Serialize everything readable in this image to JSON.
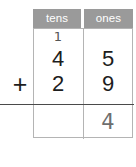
{
  "worksheet": {
    "type": "column-addition",
    "operator": "+",
    "columns": [
      {
        "key": "tens",
        "label": "tens"
      },
      {
        "key": "ones",
        "label": "ones"
      }
    ],
    "carry": {
      "tens": "1",
      "ones": ""
    },
    "addend_1": {
      "tens": "4",
      "ones": "5"
    },
    "addend_2": {
      "tens": "2",
      "ones": "9"
    },
    "sum": {
      "tens": "",
      "ones": "4"
    },
    "colors": {
      "header_background": "#9a9a9a",
      "header_text": "#ffffff",
      "grid_border": "#b4b4b4",
      "rule_line": "#4a4a4a",
      "printed_digit": "#1d1d1d",
      "handwritten_digit": "#6e6e6e",
      "carry_digit": "#555555",
      "page_background": "#ffffff"
    }
  }
}
